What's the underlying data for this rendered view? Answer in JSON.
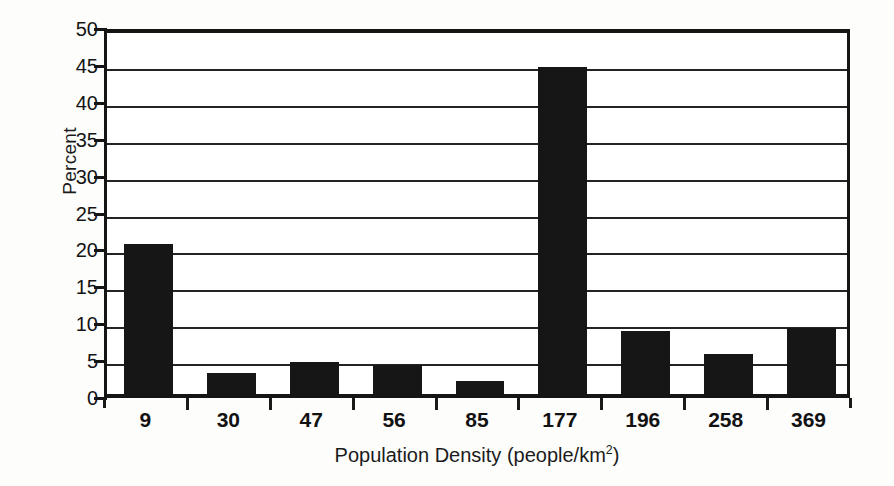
{
  "chart_data": {
    "type": "bar",
    "title": "",
    "subtitle": "",
    "xlabel_prefix": "Population Density (people/km",
    "xlabel_superscript": "2",
    "xlabel_suffix": ")",
    "xlabel": "Population Density (people/km2)",
    "ylabel": "Percent",
    "categories": [
      "9",
      "30",
      "47",
      "56",
      "85",
      "177",
      "196",
      "258",
      "369"
    ],
    "values": [
      20.3,
      2.9,
      4.4,
      3.9,
      1.8,
      44.3,
      8.5,
      5.4,
      9.0
    ],
    "ylim": [
      0,
      50
    ],
    "ytick_values": [
      0,
      5,
      10,
      15,
      20,
      25,
      30,
      35,
      40,
      45,
      50
    ],
    "ytick_labels": [
      "0",
      "5",
      "10",
      "15",
      "20",
      "25",
      "30",
      "35",
      "40",
      "45",
      "50"
    ],
    "grid": "horizontal",
    "legend": "none",
    "bar_color": "#161616",
    "axis_color": "#151515",
    "background_color": "#ffffff"
  }
}
